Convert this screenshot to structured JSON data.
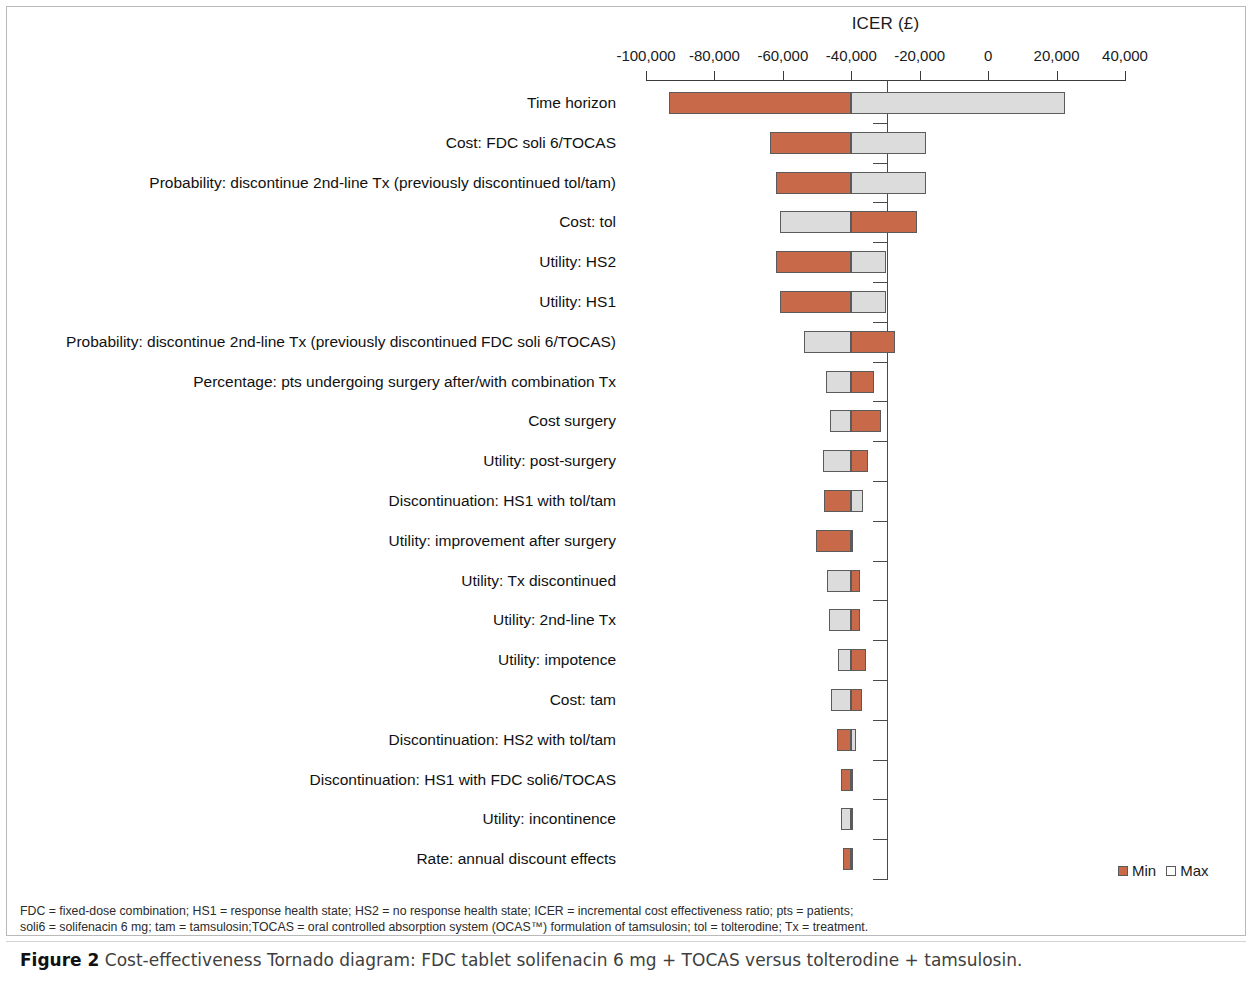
{
  "chart_data": {
    "type": "bar",
    "subtype": "tornado",
    "title": "ICER (£)",
    "xlabel": "ICER (£)",
    "ylabel": "",
    "xlim": [
      -100000,
      40000
    ],
    "xticks": [
      -100000,
      -80000,
      -60000,
      -40000,
      -20000,
      0,
      20000,
      40000
    ],
    "xticklabels": [
      "-100,000",
      "-80,000",
      "-60,000",
      "-40,000",
      "-20,000",
      "0",
      "20,000",
      "40,000"
    ],
    "baseline": -40000,
    "grid": false,
    "legend_position": "bottom-right",
    "legend": [
      "Min",
      "Max"
    ],
    "colors": {
      "min": "#c86a4a",
      "max": "#dcdcdc",
      "axis": "#3a3a3a"
    },
    "categories": [
      "Time horizon",
      "Cost: FDC soli 6/TOCAS",
      "Probability: discontinue 2nd-line Tx (previously discontinued tol/tam)",
      "Cost: tol",
      "Utility: HS2",
      "Utility: HS1",
      "Probability: discontinue 2nd-line Tx (previously discontinued FDC soli 6/TOCAS)",
      "Percentage: pts undergoing surgery after/with combination Tx",
      "Cost surgery",
      "Utility: post-surgery",
      "Discontinuation: HS1 with tol/tam",
      "Utility: improvement after surgery",
      "Utility: Tx discontinued",
      "Utility: 2nd-line Tx",
      "Utility: impotence",
      "Cost: tam",
      "Discontinuation: HS2 with tol/tam",
      "Discontinuation: HS1 with FDC soli6/TOCAS",
      "Utility: incontinence",
      "Rate: annual discount effects"
    ],
    "bars": [
      {
        "category": "Time horizon",
        "min": -93300,
        "max": 22400,
        "min_side": "left"
      },
      {
        "category": "Cost: FDC soli 6/TOCAS",
        "min": -63650,
        "max": -18100,
        "min_side": "left"
      },
      {
        "category": "Probability: discontinue 2nd-line Tx (previously discontinued tol/tam)",
        "min": -62100,
        "max": -18100,
        "min_side": "left"
      },
      {
        "category": "Cost: tol",
        "min": -20900,
        "max": -60900,
        "min_side": "right"
      },
      {
        "category": "Utility: HS2",
        "min": -61900,
        "max": -29900,
        "min_side": "left"
      },
      {
        "category": "Utility: HS1",
        "min": -60900,
        "max": -29900,
        "min_side": "left"
      },
      {
        "category": "Probability: discontinue 2nd-line Tx (previously discontinued FDC soli 6/TOCAS)",
        "min": -27200,
        "max": -53800,
        "min_side": "right"
      },
      {
        "category": "Percentage: pts undergoing surgery after/with combination Tx",
        "min": -33500,
        "max": -47500,
        "min_side": "right"
      },
      {
        "category": "Cost surgery",
        "min": -31200,
        "max": -46300,
        "min_side": "right"
      },
      {
        "category": "Utility: post-surgery",
        "min": -35200,
        "max": -48300,
        "min_side": "right"
      },
      {
        "category": "Discontinuation: HS1 with tol/tam",
        "min": -48100,
        "max": -36500,
        "min_side": "left"
      },
      {
        "category": "Utility: improvement after surgery",
        "min": -50300,
        "max": -39500,
        "min_side": "left"
      },
      {
        "category": "Utility: Tx discontinued",
        "min": -37500,
        "max": -47000,
        "min_side": "right"
      },
      {
        "category": "Utility: 2nd-line Tx",
        "min": -37500,
        "max": -46500,
        "min_side": "right"
      },
      {
        "category": "Utility: impotence",
        "min": -35700,
        "max": -43800,
        "min_side": "right"
      },
      {
        "category": "Cost: tam",
        "min": -37000,
        "max": -45800,
        "min_side": "right"
      },
      {
        "category": "Discontinuation: HS2 with tol/tam",
        "min": -44300,
        "max": -38700,
        "min_side": "left"
      },
      {
        "category": "Discontinuation: HS1 with FDC soli6/TOCAS",
        "min": -43000,
        "max": -39700,
        "min_side": "left"
      },
      {
        "category": "Utility: incontinence",
        "min": -39500,
        "max": -42900,
        "min_side": "right"
      },
      {
        "category": "Rate: annual discount effects",
        "min": -42400,
        "max": -40000,
        "min_side": "left"
      }
    ]
  },
  "footnote": {
    "line1": "FDC = fixed-dose combination; HS1 = response health state; HS2 = no response health state; ICER = incremental cost effectiveness ratio; pts = patients;",
    "line2": "soli6 = solifenacin 6 mg; tam = tamsulosin;TOCAS = oral controlled absorption system (OCAS™) formulation of tamsulosin; tol = tolterodine; Tx = treatment."
  },
  "caption": {
    "figure_number": "Figure 2",
    "text": "Cost-effectiveness Tornado diagram: FDC tablet solifenacin 6 mg + TOCAS versus tolterodine + tamsulosin."
  }
}
